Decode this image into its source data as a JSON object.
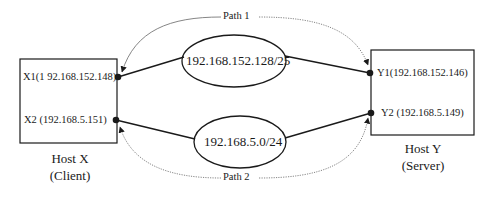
{
  "diagram": {
    "paths": [
      {
        "id": "path1",
        "label": "Path 1"
      },
      {
        "id": "path2",
        "label": "Path 2"
      }
    ],
    "networks": [
      {
        "id": "net1",
        "label": "192.168.152.128/25"
      },
      {
        "id": "net2",
        "label": "192.168.5.0/24"
      }
    ],
    "hosts": [
      {
        "id": "hostX",
        "name": "Host X",
        "role": "(Client)",
        "interfaces": [
          {
            "id": "X1",
            "label": "X1(1 92.168.152.148)"
          },
          {
            "id": "X2",
            "label": "X2 (192.168.5.151)"
          }
        ]
      },
      {
        "id": "hostY",
        "name": "Host Y",
        "role": "(Server)",
        "interfaces": [
          {
            "id": "Y1",
            "label": "Y1(192.168.152.146)"
          },
          {
            "id": "Y2",
            "label": "Y2 (192.168.5.149)"
          }
        ]
      }
    ],
    "colors": {
      "stroke": "#1a1a1a",
      "dotted": "#666666",
      "background": "#ffffff"
    }
  }
}
